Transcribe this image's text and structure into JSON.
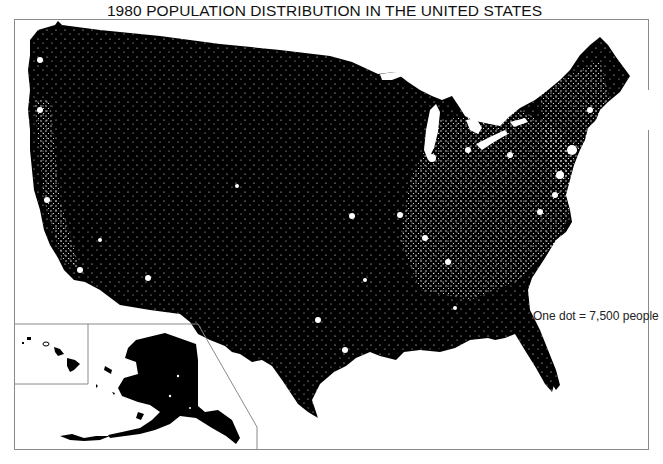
{
  "title": "1980 POPULATION DISTRIBUTION IN THE UNITED STATES",
  "legend": {
    "label": "One dot = 7,500 people",
    "dot_value": 7500,
    "unit": "people"
  },
  "insets": [
    {
      "name": "Hawaii"
    },
    {
      "name": "Alaska"
    }
  ],
  "map": {
    "region": "United States (contiguous 48 states with Alaska and Hawaii insets)",
    "year": 1980,
    "type": "dot density",
    "land_color": "#000000",
    "dot_color": "#ffffff",
    "background_color": "#ffffff",
    "frame_color": "#8a8a8a"
  }
}
